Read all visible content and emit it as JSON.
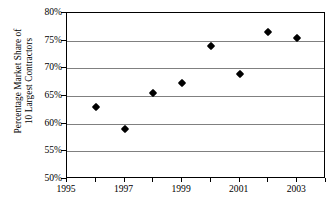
{
  "chart_data": {
    "type": "scatter",
    "title": "",
    "xlabel": "",
    "ylabel": "Percentage Market Share of 10 Largest Contractors",
    "ylabel_lines": [
      "Percentage Market Share of",
      "10 Largest Contractors"
    ],
    "grid": true,
    "legend": "none",
    "marker": "black-diamond",
    "xlim": [
      1995,
      2004
    ],
    "ylim": [
      50,
      80
    ],
    "x": [
      1996,
      1997,
      1998,
      1999,
      2000,
      2001,
      2002,
      2003
    ],
    "values": [
      63.0,
      59.0,
      65.6,
      67.4,
      74.1,
      69.0,
      76.6,
      75.4
    ],
    "series": [
      {
        "name": "Percentage Market Share of 10 Largest Contractors",
        "points": [
          {
            "x": 1996,
            "y": 63.0
          },
          {
            "x": 1997,
            "y": 59.0
          },
          {
            "x": 1998,
            "y": 65.6
          },
          {
            "x": 1999,
            "y": 67.4
          },
          {
            "x": 2000,
            "y": 74.1
          },
          {
            "x": 2001,
            "y": 69.0
          },
          {
            "x": 2002,
            "y": 76.6
          },
          {
            "x": 2003,
            "y": 75.4
          }
        ]
      }
    ],
    "y_ticks": [
      {
        "value": 80,
        "label": "80%"
      },
      {
        "value": 75,
        "label": "75%"
      },
      {
        "value": 70,
        "label": "70%"
      },
      {
        "value": 65,
        "label": "65%"
      },
      {
        "value": 60,
        "label": "60%"
      },
      {
        "value": 55,
        "label": "55%"
      },
      {
        "value": 50,
        "label": "50%"
      }
    ],
    "x_ticks": [
      {
        "value": 1995,
        "label": "1995"
      },
      {
        "value": 1996,
        "label": ""
      },
      {
        "value": 1997,
        "label": "1997"
      },
      {
        "value": 1998,
        "label": ""
      },
      {
        "value": 1999,
        "label": "1999"
      },
      {
        "value": 2000,
        "label": ""
      },
      {
        "value": 2001,
        "label": "2001"
      },
      {
        "value": 2002,
        "label": ""
      },
      {
        "value": 2003,
        "label": "2003"
      },
      {
        "value": 2004,
        "label": ""
      }
    ],
    "colors": {
      "marker": "#000000",
      "gridline": "#808080",
      "axis": "#000000",
      "background": "#ffffff"
    }
  }
}
